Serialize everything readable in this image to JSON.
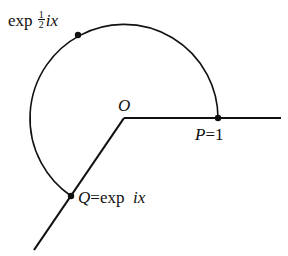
{
  "diagram": {
    "origin_label": "O",
    "point_p": {
      "name": "P",
      "eq": "=",
      "value": "1"
    },
    "point_q": {
      "name": "Q",
      "eq": "=",
      "expr_fn": "exp",
      "expr_arg": "ix"
    },
    "point_half": {
      "expr_fn": "exp",
      "frac_num": "1",
      "frac_den": "2",
      "expr_arg": "ix"
    },
    "colors": {
      "stroke": "#111111",
      "background": "#ffffff"
    }
  }
}
